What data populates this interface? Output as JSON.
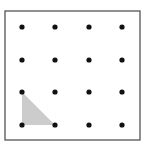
{
  "diagram": {
    "type": "dot-grid",
    "rows": 4,
    "cols": 4,
    "frame": {
      "x": 5,
      "y": 11,
      "width": 135,
      "height": 129,
      "stroke": "#555555"
    },
    "dot_color": "#111111",
    "dot_radius": 2.6,
    "col_positions": [
      22,
      55,
      89,
      122
    ],
    "row_positions": [
      27,
      60,
      92,
      125
    ],
    "shaded_triangle": {
      "fill": "#cccccc",
      "vertices": [
        [
          22,
          92
        ],
        [
          22,
          125
        ],
        [
          55,
          125
        ]
      ]
    }
  }
}
